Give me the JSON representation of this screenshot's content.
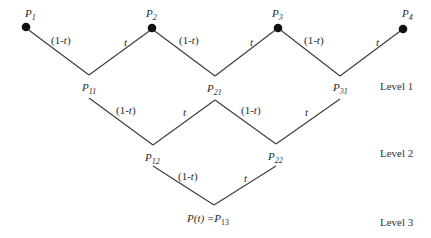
{
  "diagram": {
    "control_points": [
      {
        "id": "P1",
        "base": "P",
        "sub": "1"
      },
      {
        "id": "P2",
        "base": "P",
        "sub": "2"
      },
      {
        "id": "P3",
        "base": "P",
        "sub": "3"
      },
      {
        "id": "P4",
        "base": "P",
        "sub": "4"
      }
    ],
    "level1_points": [
      {
        "id": "P11",
        "base": "P",
        "sub": "11"
      },
      {
        "id": "P21",
        "base": "P",
        "sub": "21"
      },
      {
        "id": "P31",
        "base": "P",
        "sub": "31"
      }
    ],
    "level2_points": [
      {
        "id": "P12",
        "base": "P",
        "sub": "12"
      },
      {
        "id": "P22",
        "base": "P",
        "sub": "22"
      }
    ],
    "level3_point": {
      "id": "P13",
      "prefix": "P(t) =",
      "base": "P",
      "sub": "13",
      "prefix_p": "P(",
      "prefix_t": "t",
      "prefix_close": ") =P"
    },
    "edge_weights": {
      "left": "(1-",
      "left_t": "t",
      "left_close": ")",
      "right": "t"
    },
    "levels": [
      "Level 1",
      "Level 2",
      "Level 3"
    ]
  }
}
